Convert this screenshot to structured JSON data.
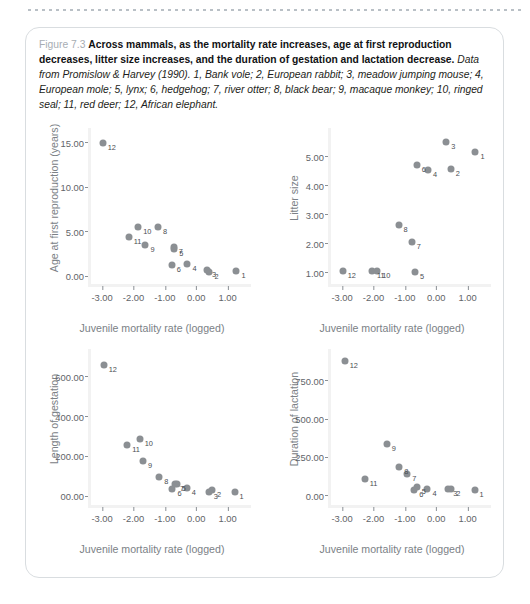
{
  "caption": {
    "number": "Figure 7.3",
    "headline": "Across mammals, as the mortality rate increases, age at first reproduction decreases, litter size increases, and the duration of gestation and lactation decrease.",
    "source": "Data from Promislow & Harvey (1990). 1, Bank vole; 2, European rabbit; 3, meadow jumping mouse; 4, European mole; 5, lynx; 6, hedgehog; 7, river otter; 8, black bear; 9, macaque monkey; 10, ringed seal; 11, red deer; 12, African elephant."
  },
  "marker_color": "#8b8f93",
  "axis_color": "#f2f2f2",
  "label_color": "#7b8186",
  "chart_data": [
    {
      "type": "scatter",
      "title": "",
      "xlabel": "Juvenile mortality rate (logged)",
      "ylabel": "Age at first reproduction (years)",
      "xlim": [
        -3.45,
        1.65
      ],
      "ylim": [
        -0.9,
        16.2
      ],
      "xticks": [
        -3.0,
        -2.0,
        -1.0,
        0.0,
        1.0
      ],
      "xticklabels": [
        "-3.00",
        "-2.00",
        "-1.00",
        "0.00",
        "1.00"
      ],
      "yticks": [
        0.0,
        5.0,
        10.0,
        15.0
      ],
      "yticklabels": [
        "0.00",
        "5.00",
        "10.00",
        "15.00"
      ],
      "grid": false,
      "points": [
        {
          "label": "1",
          "x": 1.28,
          "y": 0.55
        },
        {
          "label": "2",
          "x": 0.42,
          "y": 0.42
        },
        {
          "label": "3",
          "x": 0.34,
          "y": 0.62
        },
        {
          "label": "4",
          "x": -0.28,
          "y": 1.3
        },
        {
          "label": "5",
          "x": -0.7,
          "y": 3.0
        },
        {
          "label": "6",
          "x": -0.78,
          "y": 1.25
        },
        {
          "label": "7",
          "x": -0.72,
          "y": 3.25
        },
        {
          "label": "8",
          "x": -1.22,
          "y": 5.55
        },
        {
          "label": "9",
          "x": -1.62,
          "y": 3.5
        },
        {
          "label": "10",
          "x": -1.85,
          "y": 5.5
        },
        {
          "label": "11",
          "x": -2.15,
          "y": 4.35
        },
        {
          "label": "12",
          "x": -2.98,
          "y": 15.0
        }
      ]
    },
    {
      "type": "scatter",
      "title": "",
      "xlabel": "Juvenile mortality rate (logged)",
      "ylabel": "Litter size",
      "xlim": [
        -3.45,
        1.65
      ],
      "ylim": [
        0.62,
        5.85
      ],
      "xticks": [
        -3.0,
        -2.0,
        -1.0,
        0.0,
        1.0
      ],
      "xticklabels": [
        "-3.00",
        "-2.00",
        "-1.00",
        "0.00",
        "1.00"
      ],
      "yticks": [
        1.0,
        2.0,
        3.0,
        4.0,
        5.0
      ],
      "yticklabels": [
        "1.00",
        "2.00",
        "3.00",
        "4.00",
        "5.00"
      ],
      "grid": false,
      "points": [
        {
          "label": "1",
          "x": 1.25,
          "y": 5.15
        },
        {
          "label": "2",
          "x": 0.46,
          "y": 4.58
        },
        {
          "label": "3",
          "x": 0.32,
          "y": 5.5
        },
        {
          "label": "4",
          "x": -0.26,
          "y": 4.55
        },
        {
          "label": "5",
          "x": -0.68,
          "y": 1.05
        },
        {
          "label": "6",
          "x": -0.62,
          "y": 4.72
        },
        {
          "label": "7",
          "x": -0.78,
          "y": 2.08
        },
        {
          "label": "8",
          "x": -1.2,
          "y": 2.65
        },
        {
          "label": "10",
          "x": -1.88,
          "y": 1.08
        },
        {
          "label": "11",
          "x": -2.05,
          "y": 1.08
        },
        {
          "label": "12",
          "x": -2.98,
          "y": 1.08
        }
      ]
    },
    {
      "type": "scatter",
      "title": "",
      "xlabel": "Juvenile mortality rate (logged)",
      "ylabel": "Length of gestation",
      "xlim": [
        -3.45,
        1.65
      ],
      "ylim": [
        -45,
        720
      ],
      "xticks": [
        -3.0,
        -2.0,
        -1.0,
        0.0,
        1.0
      ],
      "xticklabels": [
        "-3.00",
        "-2.00",
        "-1.00",
        "0.00",
        "1.00"
      ],
      "yticks": [
        0,
        200,
        400,
        600
      ],
      "yticklabels": [
        "00.00",
        "200.00",
        "400.00",
        "600.00"
      ],
      "grid": false,
      "points": [
        {
          "label": "1",
          "x": 1.22,
          "y": 20
        },
        {
          "label": "2",
          "x": 0.5,
          "y": 30
        },
        {
          "label": "3",
          "x": 0.4,
          "y": 20
        },
        {
          "label": "4",
          "x": -0.3,
          "y": 42
        },
        {
          "label": "5",
          "x": -0.62,
          "y": 62
        },
        {
          "label": "6",
          "x": -0.76,
          "y": 35
        },
        {
          "label": "7",
          "x": -0.68,
          "y": 60
        },
        {
          "label": "8",
          "x": -1.18,
          "y": 98
        },
        {
          "label": "9",
          "x": -1.7,
          "y": 178
        },
        {
          "label": "10",
          "x": -1.8,
          "y": 285
        },
        {
          "label": "11",
          "x": -2.2,
          "y": 258
        },
        {
          "label": "12",
          "x": -2.95,
          "y": 660
        }
      ]
    },
    {
      "type": "scatter",
      "title": "",
      "xlabel": "Juvenile mortality rate (logged)",
      "ylabel": "Duration of lactation",
      "xlim": [
        -3.45,
        1.65
      ],
      "ylim": [
        -60,
        930
      ],
      "xticks": [
        -3.0,
        -2.0,
        -1.0,
        0.0,
        1.0
      ],
      "xticklabels": [
        "-3.00",
        "-2.00",
        "-1.00",
        "0.00",
        "1.00"
      ],
      "yticks": [
        0,
        250,
        500,
        750
      ],
      "yticklabels": [
        "0.00",
        "250.00",
        "500.00",
        "750.00"
      ],
      "grid": false,
      "points": [
        {
          "label": "1",
          "x": 1.22,
          "y": 38
        },
        {
          "label": "2",
          "x": 0.48,
          "y": 45
        },
        {
          "label": "3",
          "x": 0.38,
          "y": 45
        },
        {
          "label": "4",
          "x": -0.28,
          "y": 42
        },
        {
          "label": "5",
          "x": -0.62,
          "y": 60
        },
        {
          "label": "6",
          "x": -0.7,
          "y": 35
        },
        {
          "label": "7",
          "x": -0.92,
          "y": 145
        },
        {
          "label": "8",
          "x": -1.18,
          "y": 185
        },
        {
          "label": "9",
          "x": -1.58,
          "y": 340
        },
        {
          "label": "11",
          "x": -2.28,
          "y": 112
        },
        {
          "label": "12",
          "x": -2.92,
          "y": 880
        }
      ]
    }
  ]
}
